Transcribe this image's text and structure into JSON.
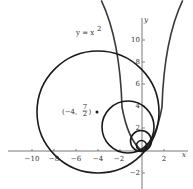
{
  "figure": {
    "curve_label": "y = x",
    "curve_label_exp": "2",
    "point_label_prefix": "(−4, ",
    "point_label_num": "7",
    "point_label_den": "2",
    "point_label_suffix": ")",
    "x_axis_name": "x",
    "y_axis_name": "y",
    "x_ticks": [
      "−10",
      "−8",
      "−6",
      "−4",
      "−2",
      "2"
    ],
    "y_ticks": [
      "10",
      "8",
      "6",
      "4",
      "2",
      "−2"
    ],
    "colors": {
      "ink": "#1a1a1a",
      "axis": "#555555",
      "curve": "#3a3a3a"
    }
  }
}
